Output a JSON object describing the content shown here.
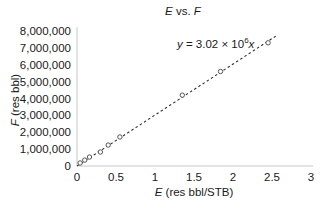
{
  "chart_data": {
    "type": "scatter",
    "title": "E vs. F",
    "title_parts": [
      {
        "text": "E",
        "italic": true
      },
      {
        "text": " vs. ",
        "italic": false
      },
      {
        "text": "F",
        "italic": true
      }
    ],
    "xlabel": "E (res bbl/STB)",
    "xlabel_parts": [
      {
        "text": "E",
        "italic": true
      },
      {
        "text": " (res bbl/STB)",
        "italic": false
      }
    ],
    "ylabel": "F (res bbl)",
    "ylabel_parts": [
      {
        "text": "F",
        "italic": true
      },
      {
        "text": " (res bbl)",
        "italic": false
      }
    ],
    "xlim": [
      0,
      3
    ],
    "ylim": [
      0,
      8000000
    ],
    "xticks": [
      0,
      0.5,
      1,
      1.5,
      2,
      2.5,
      3
    ],
    "xtick_labels": [
      "0",
      "0.5",
      "1",
      "1.5",
      "2",
      "2.5",
      "3"
    ],
    "yticks": [
      0,
      1000000,
      2000000,
      3000000,
      4000000,
      5000000,
      6000000,
      7000000,
      8000000
    ],
    "ytick_labels": [
      "0",
      "1,000,000",
      "2,000,000",
      "3,000,000",
      "4,000,000",
      "5,000,000",
      "6,000,000",
      "7,000,000",
      "8,000,000"
    ],
    "grid": false,
    "legend": null,
    "series": [
      {
        "name": "F vs E data",
        "marker": "open-circle",
        "x": [
          0.04,
          0.1,
          0.16,
          0.3,
          0.4,
          0.55,
          1.35,
          1.84,
          2.45
        ],
        "y": [
          180000,
          350000,
          530000,
          830000,
          1240000,
          1720000,
          4200000,
          5600000,
          7300000
        ]
      }
    ],
    "trendline": {
      "type": "linear-through-origin",
      "slope": 3020000,
      "x_range": [
        0,
        2.55
      ],
      "style": "dashed",
      "label": "y = 3.02 × 10⁶x",
      "label_parts": [
        {
          "text": "y",
          "italic": true
        },
        {
          "text": " = 3.02 × 10",
          "italic": false
        },
        {
          "text": "6",
          "sup": true
        },
        {
          "text": "x",
          "italic": true
        }
      ]
    }
  },
  "colors": {
    "axis": "#c8c8c8",
    "marker": "#555555",
    "trendline": "#333333",
    "text": "#1a1a1a"
  }
}
